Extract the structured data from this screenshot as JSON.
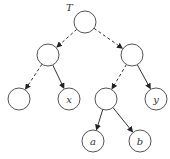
{
  "diagram": {
    "type": "binary-tree",
    "root_label": "T",
    "nodes": [
      {
        "id": "root",
        "label": "",
        "cx": 85,
        "cy": 22
      },
      {
        "id": "L",
        "label": "",
        "cx": 48,
        "cy": 55
      },
      {
        "id": "R",
        "label": "",
        "cx": 132,
        "cy": 55
      },
      {
        "id": "LL",
        "label": "",
        "cx": 19,
        "cy": 99
      },
      {
        "id": "LR",
        "label": "x",
        "cx": 69,
        "cy": 99
      },
      {
        "id": "RL",
        "label": "",
        "cx": 106,
        "cy": 99
      },
      {
        "id": "RR",
        "label": "y",
        "cx": 156,
        "cy": 99
      },
      {
        "id": "RLL",
        "label": "a",
        "cx": 93,
        "cy": 141
      },
      {
        "id": "RLR",
        "label": "b",
        "cx": 140,
        "cy": 141
      }
    ],
    "edges": [
      {
        "from": "root",
        "to": "L",
        "style": "dashed"
      },
      {
        "from": "root",
        "to": "R",
        "style": "dashed"
      },
      {
        "from": "L",
        "to": "LL",
        "style": "dashed"
      },
      {
        "from": "L",
        "to": "LR",
        "style": "solid"
      },
      {
        "from": "R",
        "to": "RL",
        "style": "dashed"
      },
      {
        "from": "R",
        "to": "RR",
        "style": "solid"
      },
      {
        "from": "RL",
        "to": "RLL",
        "style": "solid"
      },
      {
        "from": "RL",
        "to": "RLR",
        "style": "solid"
      }
    ]
  }
}
